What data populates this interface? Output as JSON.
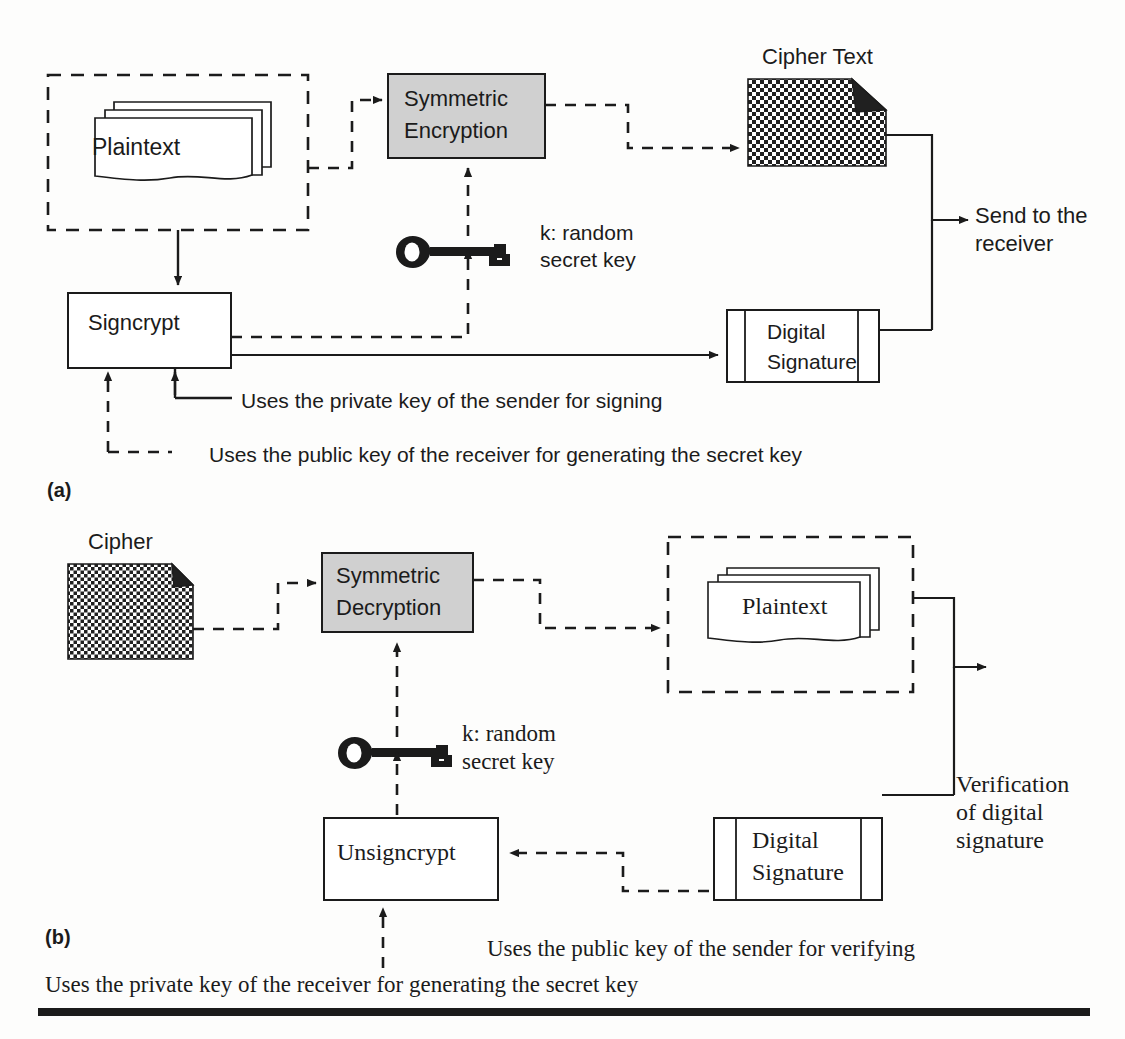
{
  "figure": {
    "colors": {
      "stroke": "#1b1b1b",
      "process_fill": "#d0d0d0",
      "page_bg": "#fdfdfc",
      "cipher_dark": "#202020"
    }
  },
  "panel_a": {
    "tag": "(a)",
    "plaintext_label": "Plaintext",
    "symmetric_box_line1": "Symmetric",
    "symmetric_box_line2": "Encryption",
    "cipher_title": "Cipher Text",
    "key_label_line1": "k: random",
    "key_label_line2": "secret key",
    "signcrypt_label": "Signcrypt",
    "digital_signature_line1": "Digital",
    "digital_signature_line2": "Signature",
    "send_label_line1": "Send to the",
    "send_label_line2": "receiver",
    "note_private_key": "Uses the private key of the sender for signing",
    "note_public_key": "Uses the public key of the receiver for generating the secret key"
  },
  "panel_b": {
    "tag": "(b)",
    "cipher_title": "Cipher",
    "symmetric_box_line1": "Symmetric",
    "symmetric_box_line2": "Decryption",
    "plaintext_label": "Plaintext",
    "key_label_line1": "k: random",
    "key_label_line2": "secret key",
    "unsigncrypt_label": "Unsigncrypt",
    "digital_signature_line1": "Digital",
    "digital_signature_line2": "Signature",
    "verification_line1": "Verification",
    "verification_line2": "of digital",
    "verification_line3": "signature",
    "note_public_key": "Uses the public key of the sender for verifying",
    "note_private_key": "Uses the private key of the receiver for generating the secret key"
  },
  "icons": {
    "key": "key-icon",
    "cipher_document": "cipher-document-icon",
    "plaintext_stack": "plaintext-stack-icon",
    "arrow_solid": "solid-arrow-icon",
    "arrow_dashed": "dashed-arrow-icon"
  }
}
